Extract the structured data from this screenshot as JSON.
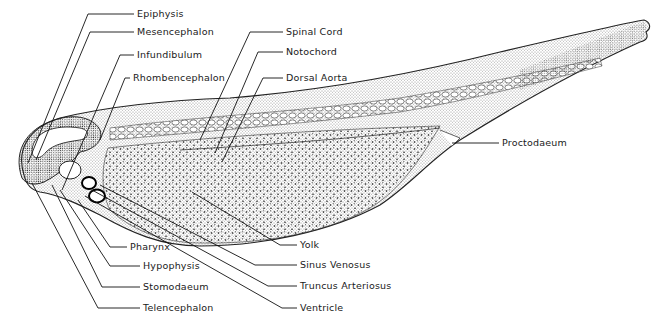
{
  "figure": {
    "colors": {
      "ink": "#111111",
      "background": "#ffffff",
      "stipple": "#222222"
    }
  },
  "labels": [
    {
      "id": "epiphysis",
      "text": "Epiphysis",
      "x": 137,
      "y": 17,
      "path": "M134,14 L88,14 L28,163"
    },
    {
      "id": "mesencephalon",
      "text": "Mesencephalon",
      "x": 137,
      "y": 35,
      "path": "M134,32 L90,32 L36,160"
    },
    {
      "id": "infundibulum",
      "text": "Infundibulum",
      "x": 137,
      "y": 58,
      "path": "M134,55 L120,55 L62,190"
    },
    {
      "id": "rhombencephalon",
      "text": "Rhombencephalon",
      "x": 133,
      "y": 81,
      "path": "M130,78 L125,78 L100,140"
    },
    {
      "id": "spinal-cord",
      "text": "Spinal  Cord",
      "x": 286,
      "y": 35,
      "path": "M283,32 L250,32 L200,140"
    },
    {
      "id": "notochord",
      "text": "Notochord",
      "x": 286,
      "y": 55,
      "path": "M283,52 L258,52 L215,153"
    },
    {
      "id": "dorsal-aorta",
      "text": "Dorsal  Aorta",
      "x": 286,
      "y": 81,
      "path": "M283,78 L263,78 L222,162"
    },
    {
      "id": "proctodaeum",
      "text": "Proctodaeum",
      "x": 502,
      "y": 146,
      "path": "M499,143 L452,143"
    },
    {
      "id": "pharynx",
      "text": "Pharynx",
      "x": 130,
      "y": 250,
      "path": "M127,247 L110,247 L78,200"
    },
    {
      "id": "hypophysis",
      "text": "Hypophysis",
      "x": 143,
      "y": 269,
      "path": "M140,266 L110,266 L60,190"
    },
    {
      "id": "stomodaeum",
      "text": "Stomodaeum",
      "x": 143,
      "y": 290,
      "path": "M140,287 L102,287 L52,185"
    },
    {
      "id": "telencephalon",
      "text": "Telencephalon",
      "x": 143,
      "y": 311,
      "path": "M140,308 L98,308 L32,183"
    },
    {
      "id": "yolk",
      "text": "Yolk",
      "x": 300,
      "y": 248,
      "path": "M297,245 L280,245 L192,192"
    },
    {
      "id": "sinus-venosus",
      "text": "Sinus  Venosus",
      "x": 300,
      "y": 268,
      "path": "M297,265 L255,265 L100,185"
    },
    {
      "id": "truncus-arteriosus",
      "text": "Truncus  Arteriosus",
      "x": 300,
      "y": 289,
      "path": "M297,286 L268,286 L92,190"
    },
    {
      "id": "ventricle",
      "text": "Ventricle",
      "x": 300,
      "y": 311,
      "path": "M297,308 L282,308 L85,196"
    }
  ]
}
